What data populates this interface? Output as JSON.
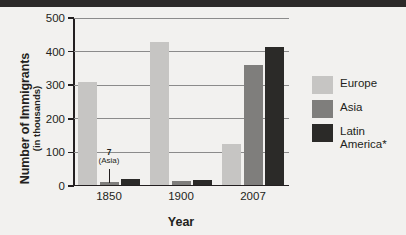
{
  "chart_data": {
    "type": "bar",
    "title": "",
    "xlabel": "Year",
    "ylabel": "Number of Immigrants (in thousands)",
    "ylabel_line1": "Number of Immigrants",
    "ylabel_line2": "(in thousands)",
    "categories": [
      "1850",
      "1900",
      "2007"
    ],
    "series": [
      {
        "name": "Europe",
        "color": "#c6c5c3",
        "values": [
          305,
          423,
          120
        ]
      },
      {
        "name": "Asia",
        "color": "#7f7e7c",
        "values": [
          7,
          10,
          355
        ]
      },
      {
        "name": "Latin America*",
        "color": "#2b2a28",
        "values": [
          15,
          14,
          410
        ]
      }
    ],
    "ylim": [
      0,
      500
    ],
    "yticks": [
      0,
      100,
      200,
      300,
      400,
      500
    ],
    "ytick_labels": [
      "0",
      "100",
      "200",
      "300",
      "400",
      "500"
    ],
    "grid": true,
    "legend_position": "right",
    "annotations": [
      {
        "value_label": "7",
        "series_label": "(Asia)",
        "points_to_series": "Asia",
        "points_to_category": "1850"
      }
    ]
  },
  "legend": {
    "items": [
      {
        "label": "Europe",
        "color": "#c6c5c3"
      },
      {
        "label": "Asia",
        "color": "#7f7e7c"
      },
      {
        "label": "Latin America*",
        "color": "#2b2a28"
      }
    ]
  }
}
